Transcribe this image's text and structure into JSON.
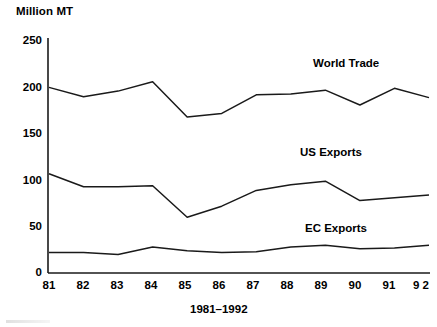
{
  "chart_data": {
    "type": "line",
    "title": "",
    "unit_label": "Million MT",
    "xlabel": "1981–1992",
    "ylabel": "Million MT",
    "categories": [
      "81",
      "82",
      "83",
      "84",
      "85",
      "86",
      "87",
      "88",
      "89",
      "90",
      "91",
      "9 2"
    ],
    "x_tick_labels": [
      "81",
      "82",
      "83",
      "84",
      "85",
      "86",
      "87",
      "88",
      "89",
      "90",
      "91",
      "9 2"
    ],
    "y_tick_labels": [
      "0",
      "50",
      "100",
      "150",
      "200",
      "250"
    ],
    "y_ticks": [
      0,
      50,
      100,
      150,
      200,
      250
    ],
    "ylim": [
      0,
      250
    ],
    "grid": false,
    "legend_position": "inline-annotations",
    "line_color": "#1a1a1a",
    "background_color": "#ffffff",
    "series": [
      {
        "name": "World Trade",
        "label": "World Trade",
        "label_x": 313,
        "label_y": 64,
        "values": [
          200,
          190,
          196,
          206,
          168,
          172,
          192,
          193,
          197,
          181,
          199,
          189
        ]
      },
      {
        "name": "US Exports",
        "label": "US Exports",
        "label_x": 300,
        "label_y": 152,
        "values": [
          107,
          93,
          93,
          94,
          60,
          72,
          89,
          95,
          99,
          78,
          81,
          84
        ]
      },
      {
        "name": "EC Exports",
        "label": "EC Exports",
        "label_x": 305,
        "label_y": 228,
        "values": [
          22,
          22,
          20,
          28,
          24,
          22,
          23,
          28,
          30,
          26,
          27,
          30
        ]
      }
    ]
  },
  "axes": {
    "y_axis_name": "value-axis",
    "x_axis_name": "year-axis",
    "x_caption": "1981–1992"
  }
}
